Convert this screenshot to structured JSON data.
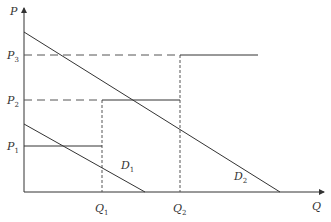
{
  "diagram": {
    "title": "",
    "axes": {
      "x_label": "Q",
      "y_label": "P"
    },
    "price_levels": [
      {
        "name": "P",
        "sub": "1"
      },
      {
        "name": "P",
        "sub": "2"
      },
      {
        "name": "P",
        "sub": "3"
      }
    ],
    "quantity_levels": [
      {
        "name": "Q",
        "sub": "1"
      },
      {
        "name": "Q",
        "sub": "2"
      }
    ],
    "curves": [
      {
        "name": "D",
        "sub": "1"
      },
      {
        "name": "D",
        "sub": "2"
      }
    ],
    "colors": {
      "line": "#333333",
      "dashed": "#555555"
    }
  }
}
